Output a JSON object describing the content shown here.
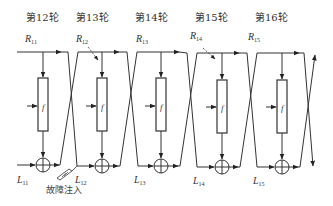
{
  "diagram": {
    "type": "feistel-round-chain",
    "rounds": [
      {
        "label": "第12轮",
        "r_label": "R",
        "r_sub": "11",
        "l_label": "L",
        "l_sub": "11",
        "f": "f",
        "fault_arrow_on_R": false
      },
      {
        "label": "第13轮",
        "r_label": "R",
        "r_sub": "12",
        "l_label": "L",
        "l_sub": "12",
        "f": "f",
        "fault_arrow_on_R": true
      },
      {
        "label": "第14轮",
        "r_label": "R",
        "r_sub": "13",
        "l_label": "L",
        "l_sub": "13",
        "f": "f",
        "fault_arrow_on_R": false
      },
      {
        "label": "第15轮",
        "r_label": "R",
        "r_sub": "14",
        "l_label": "L",
        "l_sub": "14",
        "f": "f",
        "fault_arrow_on_R": true
      },
      {
        "label": "第16轮",
        "r_label": "R",
        "r_sub": "15",
        "l_label": "L",
        "l_sub": "15",
        "f": "f",
        "fault_arrow_on_R": false
      }
    ],
    "fault_injection_label": "故障注入",
    "line_color": "#333333",
    "background": "#ffffff"
  }
}
